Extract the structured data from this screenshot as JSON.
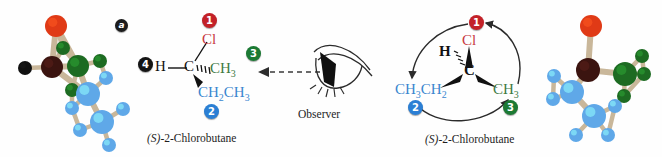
{
  "figure": {
    "panel_label": "a",
    "observer_label": "Observer"
  },
  "left_model": {
    "name": "ball-and-stick-model-left",
    "atoms": [
      {
        "element": "Cl",
        "color": "#e03a16",
        "r": 11,
        "x": 46,
        "y": 22
      },
      {
        "element": "C",
        "color": "#3b1410",
        "r": 11,
        "x": 42,
        "y": 63
      },
      {
        "element": "H",
        "color": "#101010",
        "r": 7,
        "x": 15,
        "y": 64
      },
      {
        "element": "C",
        "color": "#1d6b22",
        "r": 11,
        "x": 68,
        "y": 62
      },
      {
        "element": "H",
        "color": "#1d6b22",
        "r": 7,
        "x": 53,
        "y": 44
      },
      {
        "element": "H",
        "color": "#1d6b22",
        "r": 7,
        "x": 90,
        "y": 57
      },
      {
        "element": "H",
        "color": "#1d6b22",
        "r": 7,
        "x": 62,
        "y": 86
      },
      {
        "element": "C",
        "color": "#5fa8e8",
        "r": 12,
        "x": 78,
        "y": 90
      },
      {
        "element": "H",
        "color": "#5fa8e8",
        "r": 7,
        "x": 62,
        "y": 104
      },
      {
        "element": "H",
        "color": "#5fa8e8",
        "r": 7,
        "x": 96,
        "y": 74
      },
      {
        "element": "C",
        "color": "#5fa8e8",
        "r": 12,
        "x": 92,
        "y": 118
      },
      {
        "element": "H",
        "color": "#5fa8e8",
        "r": 7,
        "x": 70,
        "y": 126
      },
      {
        "element": "H",
        "color": "#5fa8e8",
        "r": 7,
        "x": 113,
        "y": 105
      },
      {
        "element": "H",
        "color": "#5fa8e8",
        "r": 7,
        "x": 99,
        "y": 141
      }
    ]
  },
  "right_model": {
    "name": "ball-and-stick-model-right",
    "atoms": [
      {
        "element": "Cl",
        "color": "#e03a16",
        "r": 11,
        "x": 33,
        "y": 22
      },
      {
        "element": "C",
        "color": "#3b1410",
        "r": 12,
        "x": 30,
        "y": 66
      },
      {
        "element": "C",
        "color": "#1d6b22",
        "r": 12,
        "x": 67,
        "y": 70
      },
      {
        "element": "H",
        "color": "#1d6b22",
        "r": 7,
        "x": 84,
        "y": 52
      },
      {
        "element": "H",
        "color": "#1d6b22",
        "r": 7,
        "x": 86,
        "y": 70
      },
      {
        "element": "H",
        "color": "#1d6b22",
        "r": 7,
        "x": 66,
        "y": 92
      },
      {
        "element": "C",
        "color": "#5fa8e8",
        "r": 12,
        "x": 14,
        "y": 88
      },
      {
        "element": "H",
        "color": "#5fa8e8",
        "r": 7,
        "x": -4,
        "y": 72
      },
      {
        "element": "H",
        "color": "#5fa8e8",
        "r": 7,
        "x": -5,
        "y": 95
      },
      {
        "element": "C",
        "color": "#5fa8e8",
        "r": 12,
        "x": 36,
        "y": 112
      },
      {
        "element": "H",
        "color": "#5fa8e8",
        "r": 7,
        "x": 18,
        "y": 131
      },
      {
        "element": "H",
        "color": "#5fa8e8",
        "r": 7,
        "x": 50,
        "y": 131
      },
      {
        "element": "H",
        "color": "#5fa8e8",
        "r": 7,
        "x": 57,
        "y": 102
      }
    ]
  },
  "left_structure": {
    "caption": "(S)-2-Chlorobutane",
    "caption_prefix": "(S)",
    "caption_rest": "-2-Chlorobutane",
    "labels": {
      "cl": "Cl",
      "h": "H",
      "c": "C",
      "methyl": "CH",
      "methyl_sub": "3",
      "ethyl_a": "CH",
      "ethyl_a_sub": "2",
      "ethyl_b": "CH",
      "ethyl_b_sub": "3"
    },
    "priorities": {
      "cl": "1",
      "ethyl": "2",
      "methyl": "3",
      "hydrogen": "4"
    }
  },
  "right_structure": {
    "caption": "(S)-2-Chlorobutane",
    "caption_prefix": "(S)",
    "caption_rest": "-2-Chlorobutane",
    "labels": {
      "cl": "Cl",
      "h": "H",
      "c": "C",
      "methyl": "CH",
      "methyl_sub": "3",
      "ethyl_a": "CH",
      "ethyl_a_sub": "3",
      "ethyl_b": "CH",
      "ethyl_b_sub": "2"
    },
    "priorities": {
      "cl": "1",
      "ethyl": "2",
      "methyl": "3"
    }
  },
  "colors": {
    "priority_1": "#c32128",
    "priority_2": "#2b7fd4",
    "priority_3": "#1c7a34",
    "priority_4": "#141414",
    "chlorine_text": "#c8383f",
    "methyl_text": "#3f7a44",
    "ethyl_text": "#3a86cf",
    "bond_stick": "#c9b79a",
    "background": "#ffffff"
  }
}
